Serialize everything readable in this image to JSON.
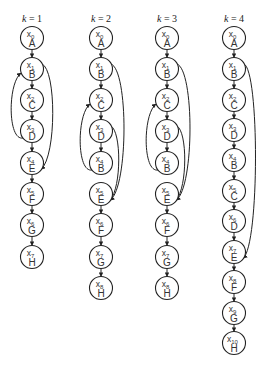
{
  "diagram": {
    "columns": [
      {
        "title_k": "k",
        "title_rest": " = 1",
        "cx": 32,
        "nodes": [
          {
            "var": "x",
            "sub": "0",
            "label": "A",
            "y": 38
          },
          {
            "var": "x",
            "sub": "1",
            "label": "B",
            "y": 69
          },
          {
            "var": "x",
            "sub": "2",
            "label": "C",
            "y": 100
          },
          {
            "var": "x",
            "sub": "3",
            "label": "D",
            "y": 131
          },
          {
            "var": "x",
            "sub": "4",
            "label": "E",
            "y": 163
          },
          {
            "var": "x",
            "sub": "5",
            "label": "F",
            "y": 194
          },
          {
            "var": "x",
            "sub": "6",
            "label": "G",
            "y": 225
          },
          {
            "var": "x",
            "sub": "7",
            "label": "H",
            "y": 257
          }
        ],
        "chain_gaps": [],
        "loops": [
          {
            "from": 3,
            "to": 1,
            "side": "left"
          },
          {
            "from": 1,
            "to": 4,
            "side": "right"
          }
        ]
      },
      {
        "title_k": "k",
        "title_rest": " = 2",
        "cx": 101,
        "nodes": [
          {
            "var": "x",
            "sub": "0",
            "label": "A",
            "y": 38
          },
          {
            "var": "x",
            "sub": "1",
            "label": "B",
            "y": 69
          },
          {
            "var": "x",
            "sub": "2",
            "label": "C",
            "y": 100
          },
          {
            "var": "x",
            "sub": "3",
            "label": "D",
            "y": 131
          },
          {
            "var": "x",
            "sub": "4",
            "label": "B",
            "y": 163
          },
          {
            "var": "x",
            "sub": "5",
            "label": "E",
            "y": 194
          },
          {
            "var": "x",
            "sub": "6",
            "label": "F",
            "y": 225
          },
          {
            "var": "x",
            "sub": "7",
            "label": "G",
            "y": 257
          },
          {
            "var": "x",
            "sub": "8",
            "label": "H",
            "y": 288
          }
        ],
        "chain_gaps": [
          4
        ],
        "loops": [
          {
            "from": 4,
            "to": 2,
            "side": "left"
          },
          {
            "from": 1,
            "to": 5,
            "side": "right",
            "offset": 16
          },
          {
            "from": 3,
            "to": 5,
            "side": "right",
            "offset": 9
          }
        ]
      },
      {
        "title_k": "k",
        "title_rest": " = 3",
        "cx": 167,
        "nodes": [
          {
            "var": "x",
            "sub": "0",
            "label": "A",
            "y": 38
          },
          {
            "var": "x",
            "sub": "1",
            "label": "B",
            "y": 69
          },
          {
            "var": "x",
            "sub": "2",
            "label": "C",
            "y": 100
          },
          {
            "var": "x",
            "sub": "3",
            "label": "D",
            "y": 131
          },
          {
            "var": "x",
            "sub": "4",
            "label": "B",
            "y": 163
          },
          {
            "var": "x",
            "sub": "5",
            "label": "E",
            "y": 194
          },
          {
            "var": "x",
            "sub": "6",
            "label": "F",
            "y": 225
          },
          {
            "var": "x",
            "sub": "7",
            "label": "G",
            "y": 257
          },
          {
            "var": "x",
            "sub": "8",
            "label": "H",
            "y": 288
          }
        ],
        "chain_gaps": [
          4
        ],
        "loops": [
          {
            "from": 4,
            "to": 2,
            "side": "left"
          },
          {
            "from": 1,
            "to": 5,
            "side": "right",
            "offset": 16
          },
          {
            "from": 3,
            "to": 5,
            "side": "right",
            "offset": 9
          }
        ]
      },
      {
        "title_k": "k",
        "title_rest": " = 4",
        "cx": 234,
        "nodes": [
          {
            "var": "x",
            "sub": "0",
            "label": "A",
            "y": 38
          },
          {
            "var": "x",
            "sub": "1",
            "label": "B",
            "y": 69
          },
          {
            "var": "x",
            "sub": "2",
            "label": "C",
            "y": 100
          },
          {
            "var": "x",
            "sub": "3",
            "label": "D",
            "y": 130
          },
          {
            "var": "x",
            "sub": "4",
            "label": "B",
            "y": 160
          },
          {
            "var": "x",
            "sub": "5",
            "label": "C",
            "y": 191
          },
          {
            "var": "x",
            "sub": "6",
            "label": "D",
            "y": 221
          },
          {
            "var": "x",
            "sub": "7",
            "label": "E",
            "y": 252
          },
          {
            "var": "x",
            "sub": "8",
            "label": "F",
            "y": 282
          },
          {
            "var": "x",
            "sub": "9",
            "label": "G",
            "y": 313
          },
          {
            "var": "x",
            "sub": "10",
            "label": "H",
            "y": 343
          }
        ],
        "chain_gaps": [],
        "loops": [
          {
            "from": 1,
            "to": 7,
            "side": "right",
            "offset": 14
          }
        ]
      }
    ],
    "node_radius": 11.5,
    "colors": {
      "stroke": "#222222",
      "text": "#333333",
      "background": "#ffffff"
    }
  }
}
